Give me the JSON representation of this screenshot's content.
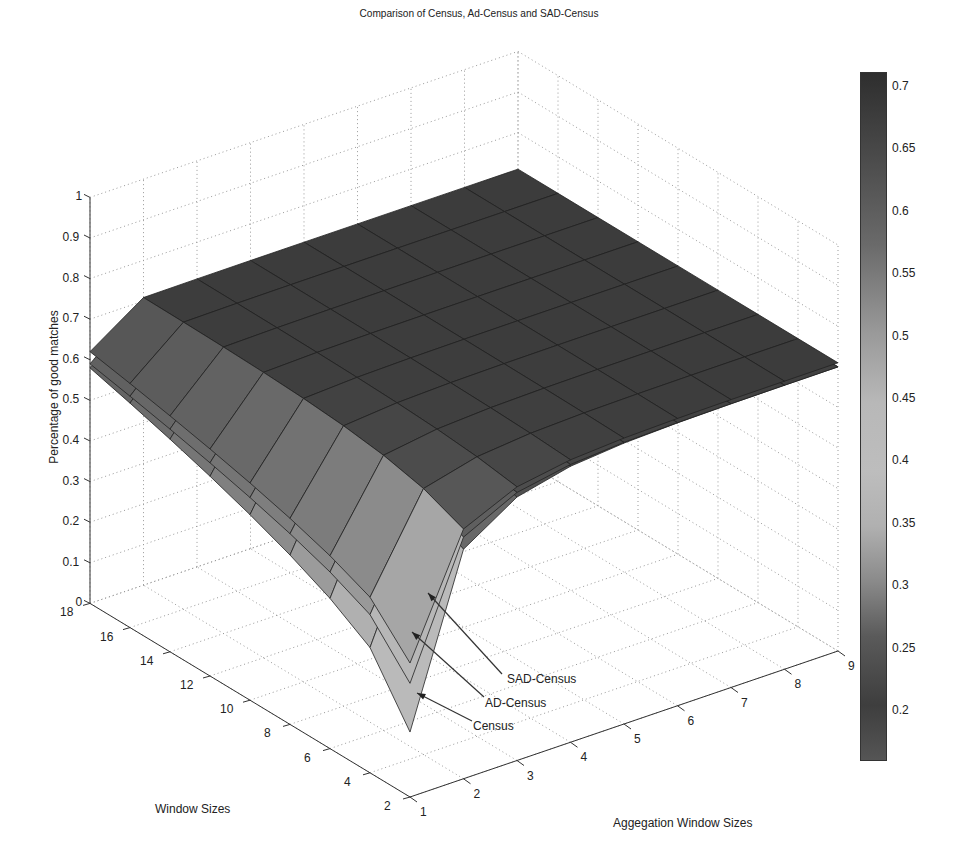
{
  "chart_data": {
    "type": "surface3d",
    "title": "Comparison of Census, Ad-Census and SAD-Census",
    "xlabel": "Aggegation Window Sizes",
    "ylabel": "Window Sizes",
    "zlabel": "Percentage of good matches",
    "x_ticks": [
      "1",
      "2",
      "3",
      "4",
      "5",
      "6",
      "7",
      "8",
      "9"
    ],
    "y_ticks": [
      "2",
      "4",
      "6",
      "8",
      "10",
      "12",
      "14",
      "16",
      "18"
    ],
    "z_ticks": [
      "0",
      "0.1",
      "0.2",
      "0.3",
      "0.4",
      "0.5",
      "0.6",
      "0.7",
      "0.8",
      "0.9",
      "1"
    ],
    "xlim": [
      1,
      9
    ],
    "ylim": [
      2,
      18
    ],
    "zlim": [
      0,
      1
    ],
    "grid": true,
    "colorbar": {
      "ticks": [
        "0.2",
        "0.25",
        "0.3",
        "0.35",
        "0.4",
        "0.45",
        "0.5",
        "0.55",
        "0.6",
        "0.65",
        "0.7"
      ],
      "range": [
        0.16,
        0.71
      ],
      "colormap": "grayscale"
    },
    "x": [
      1,
      2,
      3,
      4,
      5,
      6,
      7,
      8,
      9
    ],
    "y": [
      2,
      4,
      6,
      8,
      10,
      12,
      14,
      16,
      18
    ],
    "series": [
      {
        "name": "Census",
        "note": "lowest surface; minimum at aggregation 1, window 2",
        "min_value": 0.16,
        "edge_value_at_window_18": 0.58,
        "plateau": 0.7
      },
      {
        "name": "AD-Census",
        "min_value": 0.28,
        "edge_value_at_window_18": 0.59,
        "plateau": 0.7
      },
      {
        "name": "SAD-Census",
        "min_value": 0.33,
        "edge_value_at_window_18": 0.62,
        "plateau": 0.71
      }
    ],
    "annotations": [
      "SAD-Census",
      "AD-Census",
      "Census"
    ]
  },
  "labels": {
    "title": "Comparison of Census, Ad-Census and SAD-Census",
    "zlabel": "Percentage of good matches",
    "ylabel": "Window Sizes",
    "xlabel": "Aggegation Window Sizes",
    "ann_sad": "SAD-Census",
    "ann_ad": "AD-Census",
    "ann_census": "Census"
  }
}
